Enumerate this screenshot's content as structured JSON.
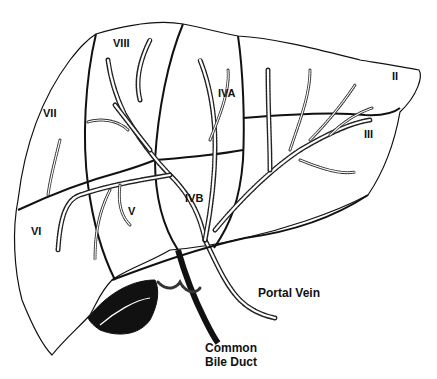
{
  "diagram": {
    "type": "anatomical-illustration",
    "colors": {
      "ink": "#111111",
      "background": "#ffffff"
    },
    "segments": [
      {
        "id": "II",
        "label": "II",
        "x": 392,
        "y": 80
      },
      {
        "id": "III",
        "label": "III",
        "x": 364,
        "y": 138
      },
      {
        "id": "IVA",
        "label": "IVA",
        "x": 218,
        "y": 97
      },
      {
        "id": "IVB",
        "label": "IVB",
        "x": 195,
        "y": 202
      },
      {
        "id": "V",
        "label": "V",
        "x": 132,
        "y": 215
      },
      {
        "id": "VI",
        "label": "VI",
        "x": 36,
        "y": 235
      },
      {
        "id": "VII",
        "label": "VII",
        "x": 50,
        "y": 117
      },
      {
        "id": "VIII",
        "label": "VIII",
        "x": 125,
        "y": 47
      }
    ],
    "structures": [
      {
        "id": "portal-vein",
        "label": "Portal Vein",
        "x": 258,
        "y": 297
      },
      {
        "id": "common-bile-duct-line1",
        "label": "Common",
        "x": 205,
        "y": 352
      },
      {
        "id": "common-bile-duct-line2",
        "label": "Bile Duct",
        "x": 205,
        "y": 366
      }
    ]
  }
}
